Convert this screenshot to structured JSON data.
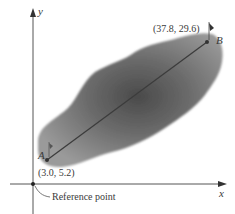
{
  "diagram": {
    "axes": {
      "x_label": "x",
      "y_label": "y"
    },
    "reference_point": {
      "label": "Reference point"
    },
    "points": [
      {
        "name": "A",
        "coord_label": "(3.0, 5.2)",
        "x": 3.0,
        "y": 5.2
      },
      {
        "name": "B",
        "coord_label": "(37.8, 29.6)",
        "x": 37.8,
        "y": 29.6
      }
    ],
    "segment": {
      "from": "A",
      "to": "B"
    },
    "colors": {
      "region_dark": "#4a4a4a",
      "region_light": "#9a9a9a",
      "axis": "#555555",
      "segment": "#3c3c3c",
      "text": "#3a3a3a"
    }
  }
}
